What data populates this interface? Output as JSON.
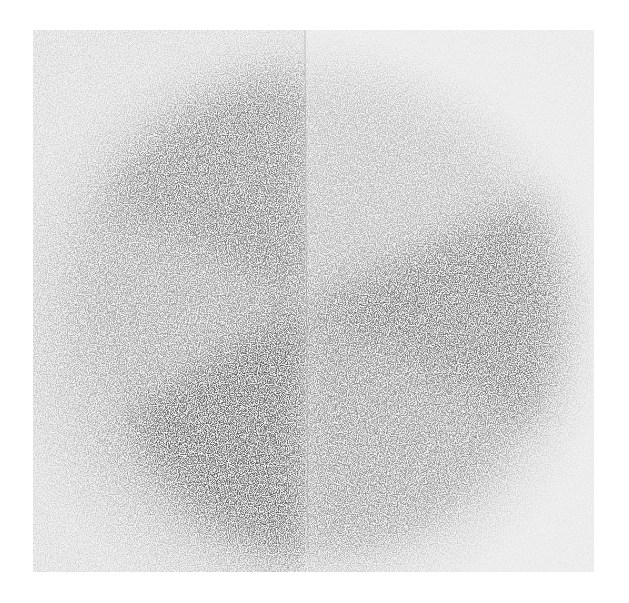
{
  "artwork": {
    "medium_appearance": "spray paint on paper, grayscale",
    "paper_color": "#f1f1f1",
    "colors": {
      "dark": "#4a4a4a",
      "mid": "#7a7a7a",
      "light": "#c8c8c8",
      "background": "#ffffff"
    }
  }
}
